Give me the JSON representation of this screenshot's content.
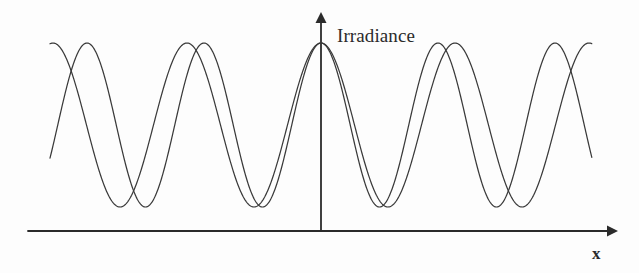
{
  "figure": {
    "background_color": "#fdfdfd",
    "line_color": "#3a3a3a",
    "axis_color": "#2b2b2b",
    "width": 639,
    "height": 273
  },
  "labels": {
    "y_axis": "Irradiance",
    "x_axis": "x"
  },
  "chart_data": {
    "type": "line",
    "title": "",
    "subtitle": "",
    "xlabel": "x",
    "ylabel": "Irradiance",
    "grid": false,
    "legend": false,
    "legend_position": "none",
    "axis_style": "arrows",
    "xlim": [
      -2.33,
      2.33
    ],
    "ylim": [
      0,
      1
    ],
    "x_origin_px": 321,
    "baseline_px": 207,
    "peak_px": 43,
    "axis_line_px": 231,
    "series": [
      {
        "name": "curve-a",
        "period_px": 117,
        "peaks_px": [
          321,
          204,
          87,
          438,
          555
        ],
        "troughs_px": [
          262,
          145,
          28,
          379,
          496,
          613
        ],
        "color": "#3a3a3a"
      },
      {
        "name": "curve-b",
        "period_px": 134,
        "peaks_px": [
          321,
          187,
          53,
          455,
          589
        ],
        "troughs_px": [
          254,
          120,
          388,
          522
        ],
        "color": "#3a3a3a"
      }
    ],
    "x": [
      -2.33,
      -2.0,
      -1.75,
      -1.5,
      -1.25,
      -1.0,
      -0.75,
      -0.5,
      -0.25,
      0,
      0.25,
      0.5,
      0.75,
      1.0,
      1.25,
      1.5,
      1.75,
      2.0,
      2.33
    ],
    "values_curve_a": [
      0.0,
      0.59,
      0.99,
      0.71,
      0.08,
      0.13,
      0.8,
      0.97,
      0.47,
      1.0,
      0.47,
      0.97,
      0.8,
      0.13,
      0.08,
      0.71,
      0.99,
      0.59,
      0.0
    ],
    "values_curve_b": [
      1.0,
      0.86,
      0.3,
      0.0,
      0.34,
      0.89,
      0.99,
      0.59,
      0.11,
      1.0,
      0.11,
      0.59,
      0.99,
      0.89,
      0.34,
      0.0,
      0.3,
      0.86,
      1.0
    ]
  }
}
